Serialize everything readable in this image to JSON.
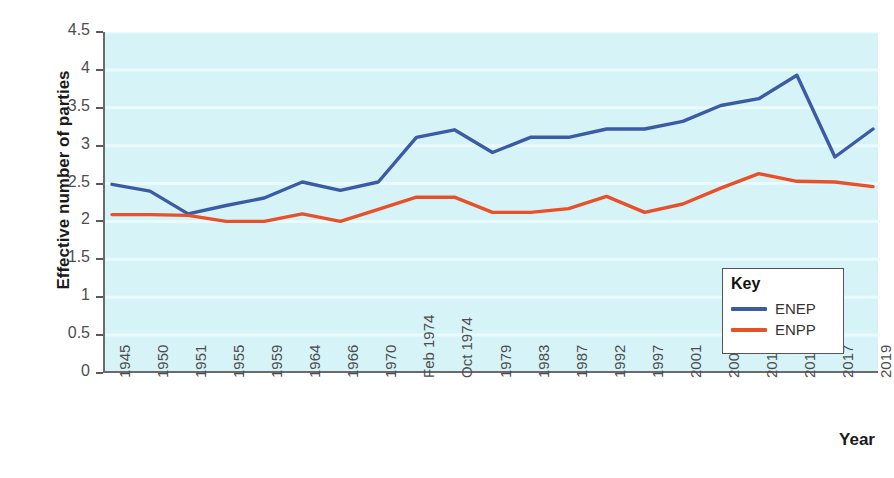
{
  "chart_data": {
    "type": "line",
    "title": "",
    "xlabel": "Year",
    "ylabel": "Effective number of parties",
    "ylim": [
      0,
      4.5
    ],
    "yticks": [
      0,
      0.5,
      1,
      1.5,
      2,
      2.5,
      3,
      3.5,
      4,
      4.5
    ],
    "ytick_labels": [
      "0",
      "0.5",
      "1",
      "1.5",
      "2",
      "2.5",
      "3",
      "3.5",
      "4",
      "4.5"
    ],
    "grid": "horizontal",
    "legend_position": "inside-bottom-right",
    "legend_title": "Key",
    "categories": [
      "1945",
      "1950",
      "1951",
      "1955",
      "1959",
      "1964",
      "1966",
      "1970",
      "Feb 1974",
      "Oct 1974",
      "1979",
      "1983",
      "1987",
      "1992",
      "1997",
      "2001",
      "2005",
      "2010",
      "2015",
      "2017",
      "2019"
    ],
    "series": [
      {
        "name": "ENEP",
        "color": "#3b5ba5",
        "values": [
          2.49,
          2.4,
          2.1,
          2.21,
          2.31,
          2.52,
          2.41,
          2.52,
          3.11,
          3.21,
          2.91,
          3.11,
          3.11,
          3.22,
          3.22,
          3.32,
          3.53,
          3.62,
          3.93,
          2.85,
          3.22
        ]
      },
      {
        "name": "ENPP",
        "color": "#e8502a",
        "values": [
          2.09,
          2.09,
          2.08,
          2.0,
          2.0,
          2.1,
          2.0,
          2.16,
          2.32,
          2.32,
          2.12,
          2.12,
          2.17,
          2.33,
          2.12,
          2.23,
          2.44,
          2.63,
          2.53,
          2.52,
          2.46
        ]
      }
    ]
  },
  "legend": {
    "title": "Key",
    "entries": [
      {
        "label": "ENEP",
        "color": "#3b5ba5"
      },
      {
        "label": "ENPP",
        "color": "#e8502a"
      }
    ]
  },
  "axes": {
    "y_title": "Effective number of parties",
    "x_title": "Year"
  },
  "colors": {
    "plot_background": "#d6f3f7",
    "gridline": "#eafbfd",
    "axis": "#6b6b6b",
    "enep": "#3b5ba5",
    "enpp": "#e8502a"
  }
}
